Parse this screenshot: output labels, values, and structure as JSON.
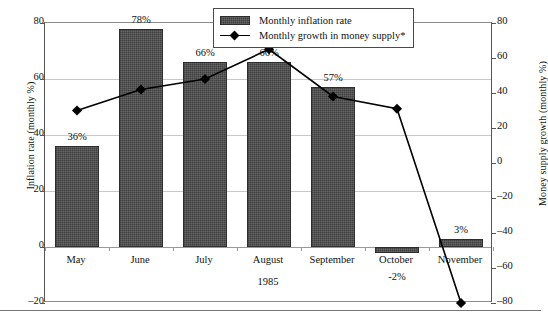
{
  "chart_data": {
    "type": "bar",
    "title": "",
    "subtitle": "",
    "categories": [
      "May",
      "June",
      "July",
      "August",
      "September",
      "October",
      "November"
    ],
    "xlabel": "1985",
    "grid": true,
    "legend_position": "top-right",
    "series": [
      {
        "name": "Monthly inflation rate",
        "type": "bar",
        "axis": "left",
        "unit": "%",
        "values": [
          36,
          78,
          66,
          66,
          57,
          -2,
          3
        ],
        "data_labels": [
          "36%",
          "78%",
          "66%",
          "66%",
          "57%",
          "-2%",
          "3%"
        ]
      },
      {
        "name": "Monthly growth in money supply*",
        "type": "line",
        "axis": "right",
        "unit": "%",
        "values": [
          30,
          42,
          48,
          65,
          38,
          31,
          -80
        ],
        "data_labels": [
          "",
          "",
          "",
          "",
          "",
          "",
          ""
        ]
      }
    ],
    "left_axis": {
      "label": "Inflation rate (monthly %)",
      "ticks": [
        80,
        60,
        40,
        20,
        0,
        -20
      ],
      "tick_labels": [
        "80",
        "60",
        "40",
        "20",
        "0",
        "–20"
      ],
      "ylim": [
        -20,
        80
      ]
    },
    "right_axis": {
      "label": "Money supply growth (monthly %)",
      "ticks": [
        80,
        60,
        40,
        20,
        0,
        -20,
        -40,
        -60,
        -80
      ],
      "tick_labels": [
        "80",
        "60",
        "40",
        "20",
        "0",
        "–20",
        "–40",
        "–60",
        "–80"
      ],
      "ylim": [
        -80,
        80
      ]
    }
  },
  "legend": {
    "items": [
      {
        "label": "Monthly inflation rate"
      },
      {
        "label": "Monthly growth in money supply*"
      }
    ]
  }
}
